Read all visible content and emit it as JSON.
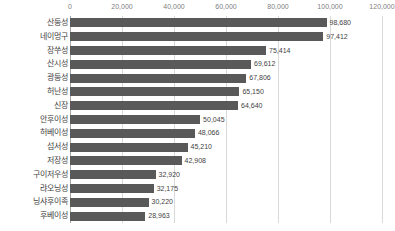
{
  "chart_data": {
    "type": "bar",
    "orientation": "horizontal",
    "title": "",
    "subtitle": "",
    "xlabel": "",
    "ylabel": "",
    "xlim": [
      0,
      120000
    ],
    "xtick_step": 20000,
    "xticks": [
      0,
      20000,
      40000,
      60000,
      80000,
      100000,
      120000
    ],
    "xtick_labels": [
      "0",
      "20,000",
      "40,000",
      "60,000",
      "80,000",
      "100,000",
      "120,000"
    ],
    "grid": "vertical",
    "legend": "none",
    "bar_color": "#595959",
    "gridline_color": "#d9d9d9",
    "axis_color": "#a6a6a6",
    "label_color": "#3f3f3f",
    "tick_color": "#808080",
    "data_labels_shown": true,
    "categories": [
      "산둥성",
      "네이멍구",
      "장쑤성",
      "산시성",
      "광둥성",
      "허난성",
      "신장",
      "안후이성",
      "허베이성",
      "섬서성",
      "저장성",
      "구이저우성",
      "랴오닝성",
      "닝샤후이족",
      "후베이성"
    ],
    "values": [
      98680,
      97412,
      75414,
      69612,
      67806,
      65150,
      64640,
      50045,
      48066,
      45210,
      42908,
      32920,
      32175,
      30220,
      28963
    ],
    "value_labels": [
      "98,680",
      "97,412",
      "75,414",
      "69,612",
      "67,806",
      "65,150",
      "64,640",
      "50,045",
      "48,066",
      "45,210",
      "42,908",
      "32,920",
      "32,175",
      "30,220",
      "28,963"
    ]
  }
}
